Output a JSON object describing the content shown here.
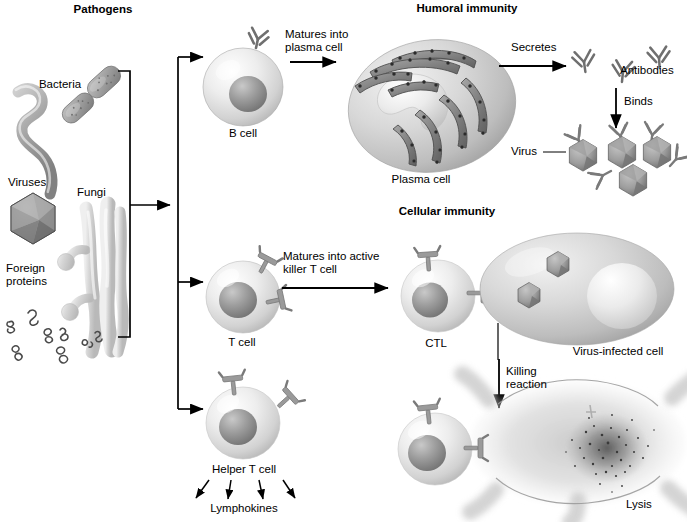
{
  "diagram": {
    "type": "biology-flow-diagram",
    "background_color": "#ffffff",
    "ink_color": "#000000",
    "cell_fill": "#d9d9d9",
    "nucleus_fill": "#8c8c8c",
    "receptor_fill": "#9a9a9a"
  },
  "headings": {
    "pathogens": "Pathogens",
    "humoral_immunity": "Humoral immunity",
    "cellular_immunity": "Cellular immunity"
  },
  "pathogens": {
    "bacteria_label": "Bacteria",
    "viruses_label": "Viruses",
    "fungi_label": "Fungi",
    "foreign_proteins_label_line1": "Foreign",
    "foreign_proteins_label_line2": "proteins"
  },
  "humoral_branch": {
    "b_cell_label": "B cell",
    "matures_line1": "Matures into",
    "matures_line2": "plasma cell",
    "plasma_cell_label": "Plasma cell",
    "secretes_label": "Secretes",
    "antibodies_label": "Antibodies",
    "binds_label": "Binds",
    "virus_label": "Virus"
  },
  "cellular_branch": {
    "t_cell_label": "T cell",
    "matures_line1": "Matures into active",
    "matures_line2": "killer T cell",
    "ctl_label": "CTL",
    "virus_infected_cell_label": "Virus-infected cell",
    "killing_line1": "Killing",
    "killing_line2": "reaction",
    "lysis_label": "Lysis"
  },
  "helper_branch": {
    "helper_t_cell_label": "Helper T cell",
    "lymphokines_label": "Lymphokines"
  }
}
